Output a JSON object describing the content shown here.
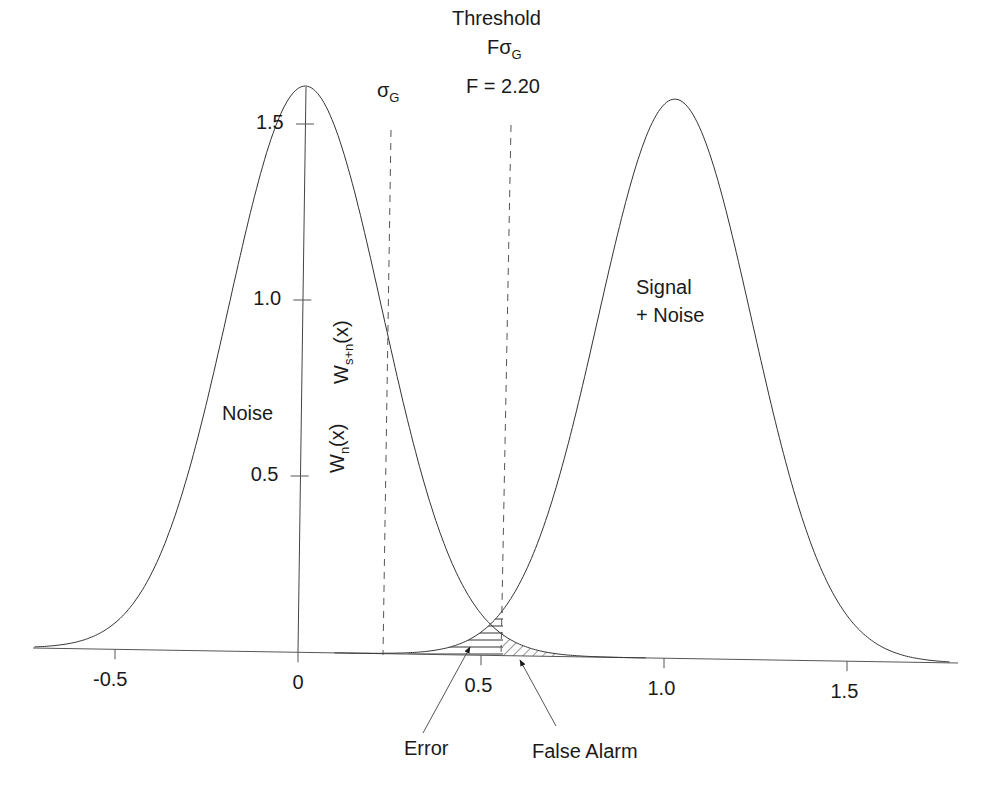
{
  "chart_data": {
    "type": "line",
    "title": "",
    "xlabel": "",
    "ylabel": "",
    "xlim": [
      -0.72,
      1.8
    ],
    "ylim": [
      0,
      1.65
    ],
    "grid": false,
    "legend": "none",
    "x_ticks": [
      "-0.5",
      "0",
      "0.5",
      "1.0",
      "1.5"
    ],
    "y_ticks": [
      "0.5",
      "1.0",
      "1.5"
    ],
    "series": [
      {
        "name": "Noise",
        "label": "W_n(x)",
        "distribution": "gaussian",
        "mean": 0.02,
        "sigma": 0.21,
        "peak": 1.6
      },
      {
        "name": "Signal + Noise",
        "label": "W_s+n(x)",
        "distribution": "gaussian",
        "mean": 1.03,
        "sigma": 0.21,
        "peak": 1.58
      }
    ],
    "vertical_lines": [
      {
        "name": "sigma_G",
        "x": 0.23,
        "style": "dashed"
      },
      {
        "name": "threshold",
        "x": 0.56,
        "style": "dashed"
      }
    ],
    "shaded_regions": [
      {
        "name": "Error",
        "hatch": "horizontal"
      },
      {
        "name": "False Alarm",
        "hatch": "diagonal"
      }
    ],
    "annotations": {
      "threshold_title": "Threshold",
      "threshold_formula_main": "Fσ",
      "threshold_formula_sub": "G",
      "f_value": "F = 2.20",
      "sigma_main": "σ",
      "sigma_sub": "G",
      "noise_label": "Noise",
      "signal_label_line1": "Signal",
      "signal_label_line2": "+ Noise",
      "wn_main": "W",
      "wn_sub": "n",
      "wn_arg": "(x)",
      "wsn_main": "W",
      "wsn_sub": "s+n",
      "wsn_arg": "(x)",
      "error_label": "Error",
      "false_alarm_label": "False Alarm"
    }
  }
}
